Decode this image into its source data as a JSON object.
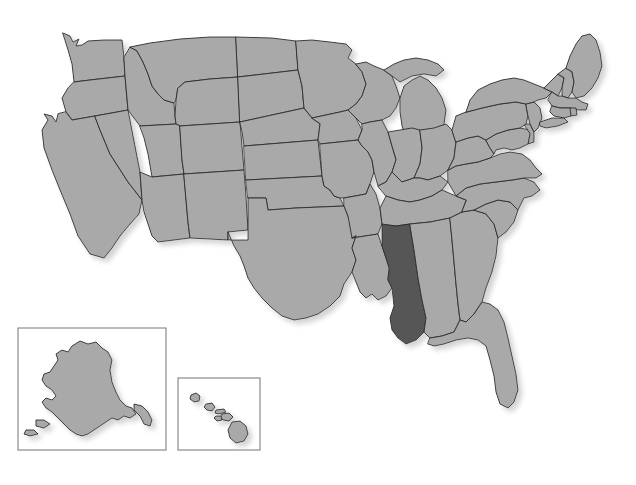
{
  "document": {
    "type": "map",
    "title": "United States map with Mississippi highlighted",
    "caption": ""
  },
  "colors": {
    "background": "#ffffff",
    "state_fill": "#a9a9a9",
    "state_stroke": "#2b2b2b",
    "highlight_fill": "#565656",
    "inset_border": "#808080",
    "shadow": "#bfbfbf"
  },
  "map": {
    "region": "United States of America",
    "projection_note": "Contiguous 48 states with Alaska and Hawaii insets",
    "highlighted_states": [
      "Mississippi"
    ],
    "state_count": 50
  },
  "insets": [
    {
      "name": "alaska-inset",
      "label": "Alaska",
      "x": 18,
      "y": 328,
      "width": 148,
      "height": 122
    },
    {
      "name": "hawaii-inset",
      "label": "Hawaii",
      "x": 178,
      "y": 378,
      "width": 82,
      "height": 72
    }
  ],
  "states": [
    {
      "abbr": "WA",
      "name": "Washington",
      "highlighted": false
    },
    {
      "abbr": "OR",
      "name": "Oregon",
      "highlighted": false
    },
    {
      "abbr": "CA",
      "name": "California",
      "highlighted": false
    },
    {
      "abbr": "NV",
      "name": "Nevada",
      "highlighted": false
    },
    {
      "abbr": "ID",
      "name": "Idaho",
      "highlighted": false
    },
    {
      "abbr": "MT",
      "name": "Montana",
      "highlighted": false
    },
    {
      "abbr": "WY",
      "name": "Wyoming",
      "highlighted": false
    },
    {
      "abbr": "UT",
      "name": "Utah",
      "highlighted": false
    },
    {
      "abbr": "AZ",
      "name": "Arizona",
      "highlighted": false
    },
    {
      "abbr": "CO",
      "name": "Colorado",
      "highlighted": false
    },
    {
      "abbr": "NM",
      "name": "New Mexico",
      "highlighted": false
    },
    {
      "abbr": "ND",
      "name": "North Dakota",
      "highlighted": false
    },
    {
      "abbr": "SD",
      "name": "South Dakota",
      "highlighted": false
    },
    {
      "abbr": "NE",
      "name": "Nebraska",
      "highlighted": false
    },
    {
      "abbr": "KS",
      "name": "Kansas",
      "highlighted": false
    },
    {
      "abbr": "OK",
      "name": "Oklahoma",
      "highlighted": false
    },
    {
      "abbr": "TX",
      "name": "Texas",
      "highlighted": false
    },
    {
      "abbr": "MN",
      "name": "Minnesota",
      "highlighted": false
    },
    {
      "abbr": "IA",
      "name": "Iowa",
      "highlighted": false
    },
    {
      "abbr": "MO",
      "name": "Missouri",
      "highlighted": false
    },
    {
      "abbr": "AR",
      "name": "Arkansas",
      "highlighted": false
    },
    {
      "abbr": "LA",
      "name": "Louisiana",
      "highlighted": false
    },
    {
      "abbr": "WI",
      "name": "Wisconsin",
      "highlighted": false
    },
    {
      "abbr": "IL",
      "name": "Illinois",
      "highlighted": false
    },
    {
      "abbr": "MI",
      "name": "Michigan",
      "highlighted": false
    },
    {
      "abbr": "IN",
      "name": "Indiana",
      "highlighted": false
    },
    {
      "abbr": "OH",
      "name": "Ohio",
      "highlighted": false
    },
    {
      "abbr": "KY",
      "name": "Kentucky",
      "highlighted": false
    },
    {
      "abbr": "TN",
      "name": "Tennessee",
      "highlighted": false
    },
    {
      "abbr": "MS",
      "name": "Mississippi",
      "highlighted": true
    },
    {
      "abbr": "AL",
      "name": "Alabama",
      "highlighted": false
    },
    {
      "abbr": "GA",
      "name": "Georgia",
      "highlighted": false
    },
    {
      "abbr": "FL",
      "name": "Florida",
      "highlighted": false
    },
    {
      "abbr": "SC",
      "name": "South Carolina",
      "highlighted": false
    },
    {
      "abbr": "NC",
      "name": "North Carolina",
      "highlighted": false
    },
    {
      "abbr": "VA",
      "name": "Virginia",
      "highlighted": false
    },
    {
      "abbr": "WV",
      "name": "West Virginia",
      "highlighted": false
    },
    {
      "abbr": "MD",
      "name": "Maryland",
      "highlighted": false
    },
    {
      "abbr": "DE",
      "name": "Delaware",
      "highlighted": false
    },
    {
      "abbr": "PA",
      "name": "Pennsylvania",
      "highlighted": false
    },
    {
      "abbr": "NJ",
      "name": "New Jersey",
      "highlighted": false
    },
    {
      "abbr": "NY",
      "name": "New York",
      "highlighted": false
    },
    {
      "abbr": "CT",
      "name": "Connecticut",
      "highlighted": false
    },
    {
      "abbr": "RI",
      "name": "Rhode Island",
      "highlighted": false
    },
    {
      "abbr": "MA",
      "name": "Massachusetts",
      "highlighted": false
    },
    {
      "abbr": "VT",
      "name": "Vermont",
      "highlighted": false
    },
    {
      "abbr": "NH",
      "name": "New Hampshire",
      "highlighted": false
    },
    {
      "abbr": "ME",
      "name": "Maine",
      "highlighted": false
    },
    {
      "abbr": "AK",
      "name": "Alaska",
      "highlighted": false
    },
    {
      "abbr": "HI",
      "name": "Hawaii",
      "highlighted": false
    }
  ]
}
